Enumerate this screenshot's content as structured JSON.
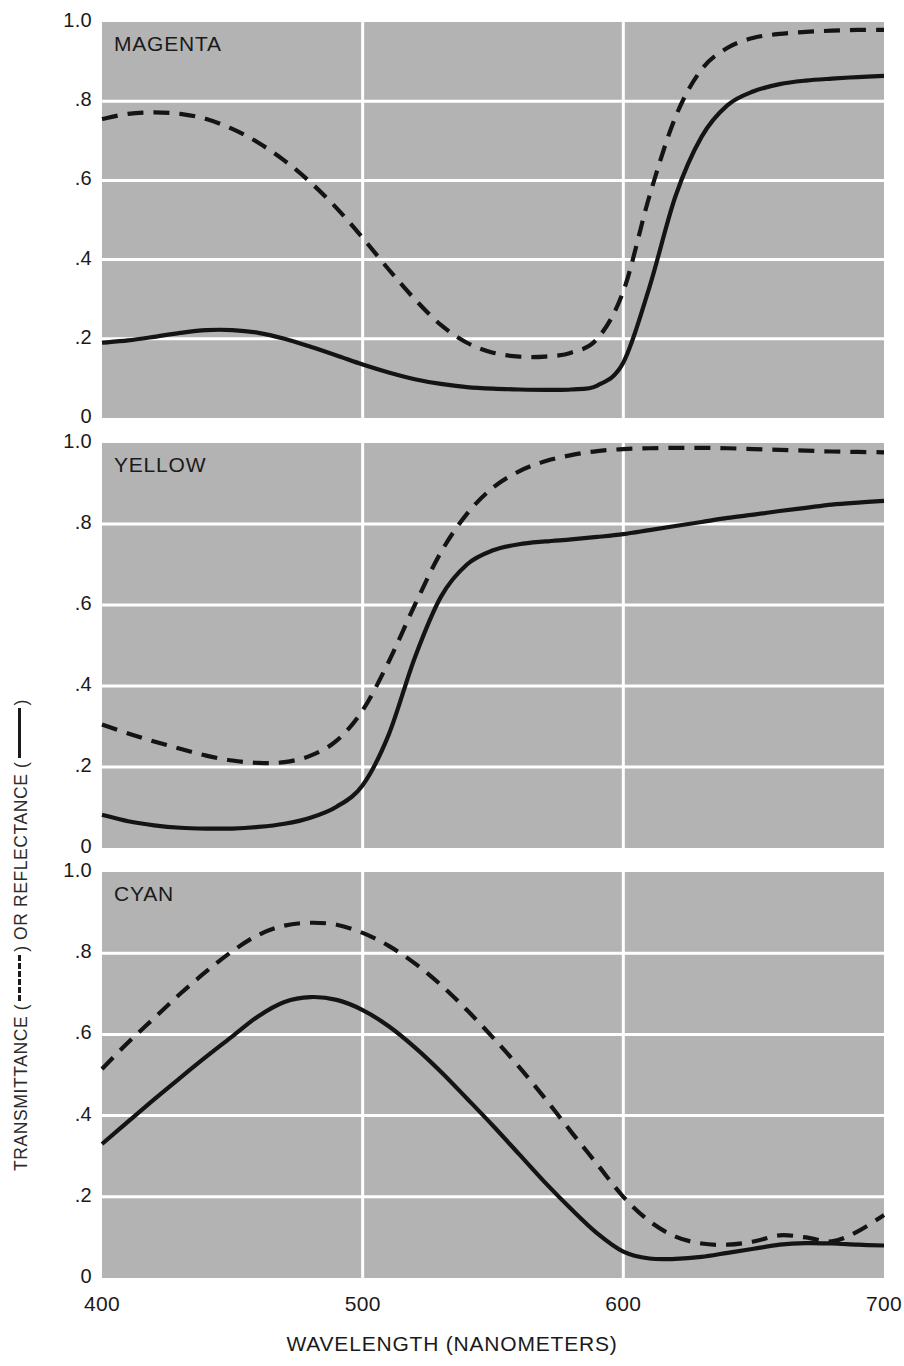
{
  "axes": {
    "y_title_parts": {
      "part1": "TRANSMITTANCE (",
      "part2": ") OR REFLECTANCE (",
      "part3": ")"
    },
    "y_ticks": [
      "1.0",
      ".8",
      ".6",
      ".4",
      ".2",
      "0"
    ],
    "x_ticks": [
      "400",
      "500",
      "600",
      "700"
    ],
    "x_title": "WAVELENGTH (NANOMETERS)"
  },
  "style": {
    "panel_fill": "#b3b3b3",
    "grid_color": "#ffffff",
    "curve_color": "#141414",
    "page_bg": "#ffffff"
  },
  "panels": [
    {
      "title": "MAGENTA"
    },
    {
      "title": "YELLOW"
    },
    {
      "title": "CYAN"
    }
  ],
  "chart_data": [
    {
      "type": "line",
      "title": "MAGENTA",
      "xlabel": "WAVELENGTH (NANOMETERS)",
      "ylabel": "TRANSMITTANCE (dashed) OR REFLECTANCE (solid)",
      "xlim": [
        400,
        700
      ],
      "ylim": [
        0,
        1.0
      ],
      "xticks": [
        400,
        500,
        600,
        700
      ],
      "yticks": [
        0,
        0.2,
        0.4,
        0.6,
        0.8,
        1.0
      ],
      "grid": true,
      "legend": "none",
      "x": [
        400,
        410,
        420,
        430,
        440,
        450,
        460,
        470,
        480,
        490,
        500,
        510,
        520,
        530,
        540,
        550,
        560,
        570,
        580,
        590,
        600,
        610,
        620,
        630,
        640,
        650,
        660,
        670,
        680,
        690,
        700
      ],
      "series": [
        {
          "name": "Transmittance",
          "linestyle": "dashed",
          "values": [
            0.755,
            0.768,
            0.772,
            0.768,
            0.755,
            0.73,
            0.695,
            0.65,
            0.595,
            0.53,
            0.455,
            0.375,
            0.3,
            0.235,
            0.19,
            0.165,
            0.155,
            0.155,
            0.165,
            0.2,
            0.32,
            0.56,
            0.76,
            0.88,
            0.935,
            0.96,
            0.97,
            0.975,
            0.978,
            0.98,
            0.98
          ]
        },
        {
          "name": "Reflectance",
          "linestyle": "solid",
          "values": [
            0.19,
            0.196,
            0.205,
            0.215,
            0.222,
            0.222,
            0.215,
            0.2,
            0.18,
            0.158,
            0.135,
            0.115,
            0.098,
            0.086,
            0.078,
            0.074,
            0.072,
            0.071,
            0.072,
            0.082,
            0.14,
            0.33,
            0.56,
            0.71,
            0.79,
            0.825,
            0.843,
            0.852,
            0.857,
            0.861,
            0.864
          ]
        }
      ]
    },
    {
      "type": "line",
      "title": "YELLOW",
      "xlabel": "WAVELENGTH (NANOMETERS)",
      "ylabel": "TRANSMITTANCE (dashed) OR REFLECTANCE (solid)",
      "xlim": [
        400,
        700
      ],
      "ylim": [
        0,
        1.0
      ],
      "xticks": [
        400,
        500,
        600,
        700
      ],
      "yticks": [
        0,
        0.2,
        0.4,
        0.6,
        0.8,
        1.0
      ],
      "grid": true,
      "legend": "none",
      "x": [
        400,
        410,
        420,
        430,
        440,
        450,
        460,
        470,
        480,
        490,
        500,
        510,
        520,
        530,
        540,
        550,
        560,
        570,
        580,
        590,
        600,
        610,
        620,
        630,
        640,
        650,
        660,
        670,
        680,
        690,
        700
      ],
      "series": [
        {
          "name": "Transmittance",
          "linestyle": "dashed",
          "values": [
            0.305,
            0.283,
            0.263,
            0.245,
            0.228,
            0.216,
            0.21,
            0.212,
            0.228,
            0.265,
            0.34,
            0.46,
            0.6,
            0.73,
            0.825,
            0.89,
            0.93,
            0.955,
            0.97,
            0.98,
            0.985,
            0.987,
            0.988,
            0.988,
            0.987,
            0.985,
            0.983,
            0.981,
            0.979,
            0.978,
            0.977
          ]
        },
        {
          "name": "Reflectance",
          "linestyle": "solid",
          "values": [
            0.082,
            0.066,
            0.056,
            0.05,
            0.048,
            0.048,
            0.052,
            0.06,
            0.075,
            0.102,
            0.155,
            0.28,
            0.47,
            0.62,
            0.7,
            0.735,
            0.75,
            0.757,
            0.762,
            0.768,
            0.775,
            0.785,
            0.795,
            0.805,
            0.815,
            0.823,
            0.832,
            0.84,
            0.848,
            0.853,
            0.857
          ]
        }
      ]
    },
    {
      "type": "line",
      "title": "CYAN",
      "xlabel": "WAVELENGTH (NANOMETERS)",
      "ylabel": "TRANSMITTANCE (dashed) OR REFLECTANCE (solid)",
      "xlim": [
        400,
        700
      ],
      "ylim": [
        0,
        1.0
      ],
      "xticks": [
        400,
        500,
        600,
        700
      ],
      "yticks": [
        0,
        0.2,
        0.4,
        0.6,
        0.8,
        1.0
      ],
      "grid": true,
      "legend": "none",
      "x": [
        400,
        410,
        420,
        430,
        440,
        450,
        460,
        470,
        480,
        490,
        500,
        510,
        520,
        530,
        540,
        550,
        560,
        570,
        580,
        590,
        600,
        610,
        620,
        630,
        640,
        650,
        660,
        670,
        680,
        690,
        700
      ],
      "series": [
        {
          "name": "Transmittance",
          "linestyle": "dashed",
          "values": [
            0.515,
            0.58,
            0.64,
            0.7,
            0.755,
            0.805,
            0.845,
            0.868,
            0.875,
            0.87,
            0.85,
            0.818,
            0.775,
            0.722,
            0.66,
            0.592,
            0.52,
            0.442,
            0.36,
            0.28,
            0.2,
            0.14,
            0.102,
            0.085,
            0.082,
            0.09,
            0.105,
            0.1,
            0.09,
            0.115,
            0.155
          ]
        },
        {
          "name": "Reflectance",
          "linestyle": "solid",
          "values": [
            0.33,
            0.385,
            0.44,
            0.493,
            0.545,
            0.595,
            0.645,
            0.68,
            0.692,
            0.685,
            0.66,
            0.62,
            0.568,
            0.508,
            0.442,
            0.375,
            0.305,
            0.235,
            0.17,
            0.11,
            0.065,
            0.048,
            0.047,
            0.052,
            0.062,
            0.072,
            0.082,
            0.086,
            0.085,
            0.082,
            0.08
          ]
        }
      ]
    }
  ]
}
